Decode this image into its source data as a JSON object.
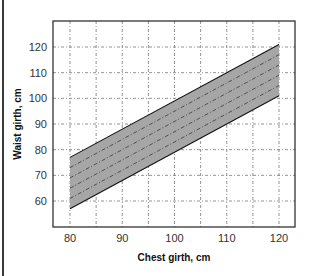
{
  "chart_data": {
    "type": "area",
    "title": "",
    "xlabel": "Chest girth, cm",
    "ylabel": "Waist girth, cm",
    "xlim": [
      77,
      123
    ],
    "ylim": [
      50,
      128
    ],
    "x_ticks": [
      "80",
      "90",
      "100",
      "110",
      "120"
    ],
    "y_ticks": [
      "60",
      "70",
      "80",
      "90",
      "100",
      "110",
      "120"
    ],
    "grid": true,
    "x": [
      80,
      120
    ],
    "band": {
      "name": "Waist girth range",
      "lower": [
        57,
        101
      ],
      "upper": [
        77,
        121
      ],
      "fill": "#a6a6a6"
    },
    "series": [
      {
        "name": "upper boundary",
        "values": [
          77,
          121
        ],
        "style": "solid"
      },
      {
        "name": "dashed 1",
        "values": [
          73,
          117
        ],
        "style": "dash-dot"
      },
      {
        "name": "dashed 2",
        "values": [
          69,
          113
        ],
        "style": "dash-dot"
      },
      {
        "name": "dashed 3",
        "values": [
          65,
          109
        ],
        "style": "dash-dot"
      },
      {
        "name": "dashed 4",
        "values": [
          61,
          105
        ],
        "style": "dash-dot"
      },
      {
        "name": "lower boundary",
        "values": [
          57,
          101
        ],
        "style": "solid"
      }
    ]
  }
}
